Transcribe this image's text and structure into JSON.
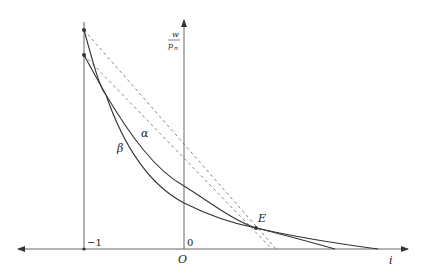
{
  "diagram": {
    "axes": {
      "x_label": "i",
      "y_label_numerator": "w",
      "y_label_denominator": "p",
      "y_label_subscript": "n",
      "origin_label": "O",
      "tick_zero": "0",
      "tick_minus_one": "−1"
    },
    "curves": [
      {
        "name": "alpha",
        "label": "α"
      },
      {
        "name": "beta",
        "label": "β"
      }
    ],
    "points": [
      {
        "name": "E",
        "label": "E"
      }
    ],
    "colors": {
      "axis": "#555555",
      "curve": "#333333",
      "dashed": "#777777",
      "text": "#222222"
    }
  }
}
